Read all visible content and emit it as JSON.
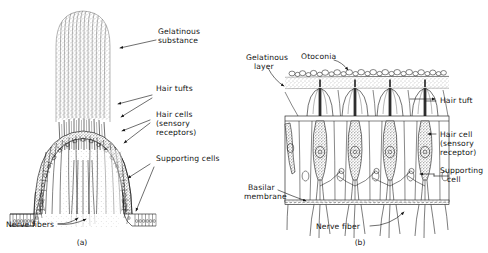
{
  "figure": {
    "background_color": "#ffffff",
    "ink_color": "#141414",
    "style": "black-and-white stippled line drawing"
  },
  "panel_a": {
    "caption": "(a)",
    "subject": "crista ampullaris with cupula",
    "labels": [
      {
        "id": "gelatinous-substance",
        "line1": "Gelatinous",
        "line2": "substance"
      },
      {
        "id": "hair-tufts",
        "line1": "Hair  tufts",
        "line2": ""
      },
      {
        "id": "hair-cells",
        "line1": "Hair cells",
        "line2": "(sensory",
        "line3": "receptors)"
      },
      {
        "id": "supporting-cells",
        "line1": "Supporting cells",
        "line2": ""
      },
      {
        "id": "nerve-fibers",
        "line1": "Nerve fibers",
        "line2": ""
      }
    ]
  },
  "panel_b": {
    "caption": "(b)",
    "subject": "macula with otoconia",
    "labels": [
      {
        "id": "gelatinous-layer",
        "line1": "Gelatinous",
        "line2": "layer"
      },
      {
        "id": "otoconia",
        "line1": "Otoconia",
        "line2": ""
      },
      {
        "id": "hair-tuft",
        "line1": "Hair tuft",
        "line2": ""
      },
      {
        "id": "hair-cell",
        "line1": "Hair cell",
        "line2": "(sensory",
        "line3": "receptor)"
      },
      {
        "id": "supporting-cell",
        "line1": "Supporting",
        "line2": "cell"
      },
      {
        "id": "basilar-membrane",
        "line1": "Basilar",
        "line2": "membrane"
      },
      {
        "id": "nerve-fiber",
        "line1": "Nerve fiber",
        "line2": ""
      }
    ],
    "hair_cell_count": 4
  }
}
